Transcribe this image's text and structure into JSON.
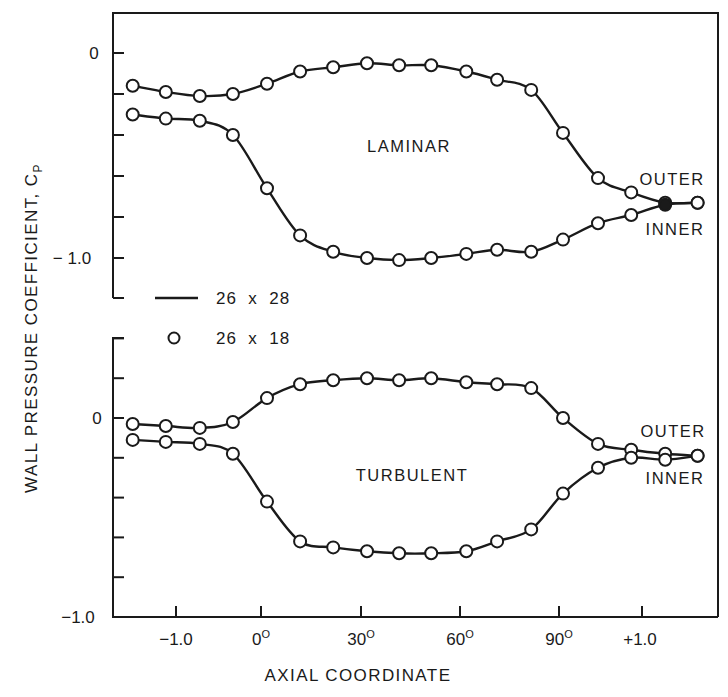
{
  "chart_data": {
    "type": "line",
    "title": "",
    "xlabel": "AXIAL COORDINATE",
    "ylabel": "WALL PRESSURE COEFFICIENT, C",
    "ylabel_subscript": "P",
    "x_tick_labels": [
      {
        "label": "−1.0",
        "sup": ""
      },
      {
        "label": "0",
        "sup": "O"
      },
      {
        "label": "30",
        "sup": "O"
      },
      {
        "label": "60",
        "sup": "O"
      },
      {
        "label": "90",
        "sup": "O"
      },
      {
        "label": "+1.0",
        "sup": ""
      }
    ],
    "x_note": "Piecewise axis: inlet straight section (-1.0 to 0), bend angle (0° to 90°), outlet straight section (0 to +1.0)",
    "x": [
      -1.51,
      -1.12,
      -0.72,
      -0.33,
      1.8,
      11.8,
      21.8,
      32.0,
      41.7,
      51.4,
      62.0,
      71.3,
      81.6,
      91.2,
      0.47,
      0.87,
      1.28,
      1.67
    ],
    "x_segment": [
      "in",
      "in",
      "in",
      "in",
      "bend",
      "bend",
      "bend",
      "bend",
      "bend",
      "bend",
      "bend",
      "bend",
      "bend",
      "bend",
      "out",
      "out",
      "out",
      "out"
    ],
    "legend": [
      {
        "symbol": "line",
        "label": "26  x  28"
      },
      {
        "symbol": "circle",
        "label": "26  x  18"
      }
    ],
    "panels": [
      {
        "name": "LAMINAR",
        "ylim": [
          -1.2,
          0.2
        ],
        "y_tick_labels": [
          "0",
          "− 1.0"
        ],
        "y_ticks": [
          0,
          -0.2,
          -0.4,
          -0.6,
          -0.8,
          -1.0
        ],
        "series": [
          {
            "name": "OUTER",
            "values": [
              -0.16,
              -0.19,
              -0.21,
              -0.2,
              -0.15,
              -0.09,
              -0.07,
              -0.05,
              -0.06,
              -0.06,
              -0.09,
              -0.13,
              -0.18,
              -0.39,
              -0.61,
              -0.68,
              -0.73,
              -0.73
            ]
          },
          {
            "name": "INNER",
            "values": [
              -0.3,
              -0.32,
              -0.33,
              -0.4,
              -0.66,
              -0.89,
              -0.97,
              -1.0,
              -1.01,
              -1.0,
              -0.98,
              -0.96,
              -0.97,
              -0.91,
              -0.83,
              -0.79,
              -0.74,
              -0.73
            ]
          }
        ]
      },
      {
        "name": "TURBULENT",
        "ylim": [
          -1.0,
          0.4
        ],
        "y_tick_labels": [
          "0",
          "−1.0"
        ],
        "y_ticks": [
          0.4,
          0.2,
          0,
          -0.2,
          -0.4,
          -0.6,
          -0.8,
          -1.0
        ],
        "series": [
          {
            "name": "OUTER",
            "values": [
              -0.03,
              -0.04,
              -0.05,
              -0.02,
              0.1,
              0.17,
              0.19,
              0.2,
              0.19,
              0.2,
              0.18,
              0.17,
              0.15,
              0.0,
              -0.13,
              -0.16,
              -0.18,
              -0.19
            ]
          },
          {
            "name": "INNER",
            "values": [
              -0.11,
              -0.12,
              -0.13,
              -0.18,
              -0.42,
              -0.62,
              -0.65,
              -0.67,
              -0.68,
              -0.68,
              -0.67,
              -0.62,
              -0.56,
              -0.38,
              -0.25,
              -0.2,
              -0.21,
              -0.19
            ]
          }
        ]
      }
    ],
    "grid": false,
    "legend_position": "between panels, left"
  },
  "colors": {
    "ink": "#1a1a1a",
    "background": "#ffffff"
  }
}
